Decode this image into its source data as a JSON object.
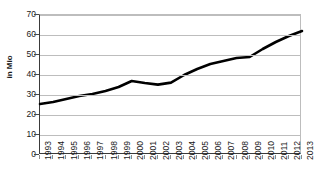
{
  "chart_data": {
    "type": "line",
    "title": "",
    "xlabel": "",
    "ylabel": "in Mio",
    "ylim": [
      0,
      70
    ],
    "ytick_values": [
      70,
      60,
      50,
      40,
      30,
      20,
      10,
      0
    ],
    "grid": true,
    "legend": "none",
    "line_color": "#000000",
    "grid_color": "#bdbdbd",
    "axis_color": "#3a3a3a",
    "categories": [
      "1993",
      "1994",
      "1995",
      "1996",
      "1997",
      "1998",
      "1999",
      "2000",
      "2001",
      "2002",
      "2003",
      "2004",
      "2005",
      "2006",
      "2007",
      "2008",
      "2009",
      "2010",
      "2011",
      "2012",
      "2013"
    ],
    "values": [
      25.5,
      26.5,
      28.0,
      29.5,
      30.5,
      32.0,
      34.0,
      37.0,
      36.0,
      35.2,
      36.2,
      40.0,
      43.0,
      45.5,
      47.0,
      48.5,
      49.0,
      53.0,
      56.5,
      59.5,
      62.0
    ]
  },
  "axis": {
    "y_title": "in Mio"
  }
}
